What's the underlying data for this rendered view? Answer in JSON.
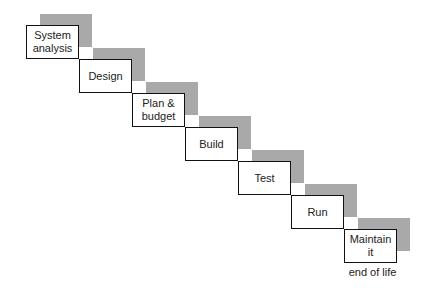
{
  "diagram": {
    "type": "waterfall-staircase",
    "colors": {
      "shadow": "#a9a9a9",
      "border": "#111111",
      "text": "#222222"
    },
    "steps": [
      {
        "label": "System\nanalysis"
      },
      {
        "label": "Design"
      },
      {
        "label": "Plan &\nbudget"
      },
      {
        "label": "Build"
      },
      {
        "label": "Test"
      },
      {
        "label": "Run"
      },
      {
        "label": "Maintain\nit"
      }
    ],
    "end_note": "end of life"
  }
}
